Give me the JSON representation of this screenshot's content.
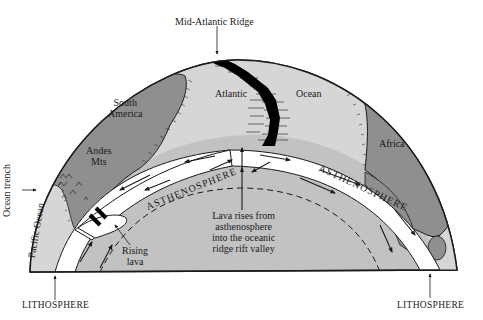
{
  "diagram": {
    "colors": {
      "background": "#ffffff",
      "ocean_crust": "#d4d4d4",
      "continent": "#8f8f8f",
      "asthenosphere": "#c2c2c2",
      "lithosphere_channel": "#ffffff",
      "outline": "#1a1a1a",
      "ridge": "#000000"
    },
    "labels": {
      "mid_atlantic_ridge": "Mid-Atlantic Ridge",
      "south_america_line1": "South",
      "south_america_line2": "America",
      "atlantic": "Atlantic",
      "ocean": "Ocean",
      "africa": "Africa",
      "andes_line1": "Andes",
      "andes_line2": "Mts",
      "ocean_trench": "Ocean trench",
      "pacific_ocean": "Pacific Ocean",
      "asthenosphere_left": "ASTHENOSPHERE",
      "asthenosphere_right": "ASTHENOSPHERE",
      "rising_lava_line1": "Rising",
      "rising_lava_line2": "lava",
      "lava_rises_line1": "Lava rises from",
      "lava_rises_line2": "asthenosphere",
      "lava_rises_line3": "into the oceanic",
      "lava_rises_line4": "ridge rift valley",
      "lithosphere_left": "LITHOSPHERE",
      "lithosphere_right": "LITHOSPHERE"
    }
  }
}
